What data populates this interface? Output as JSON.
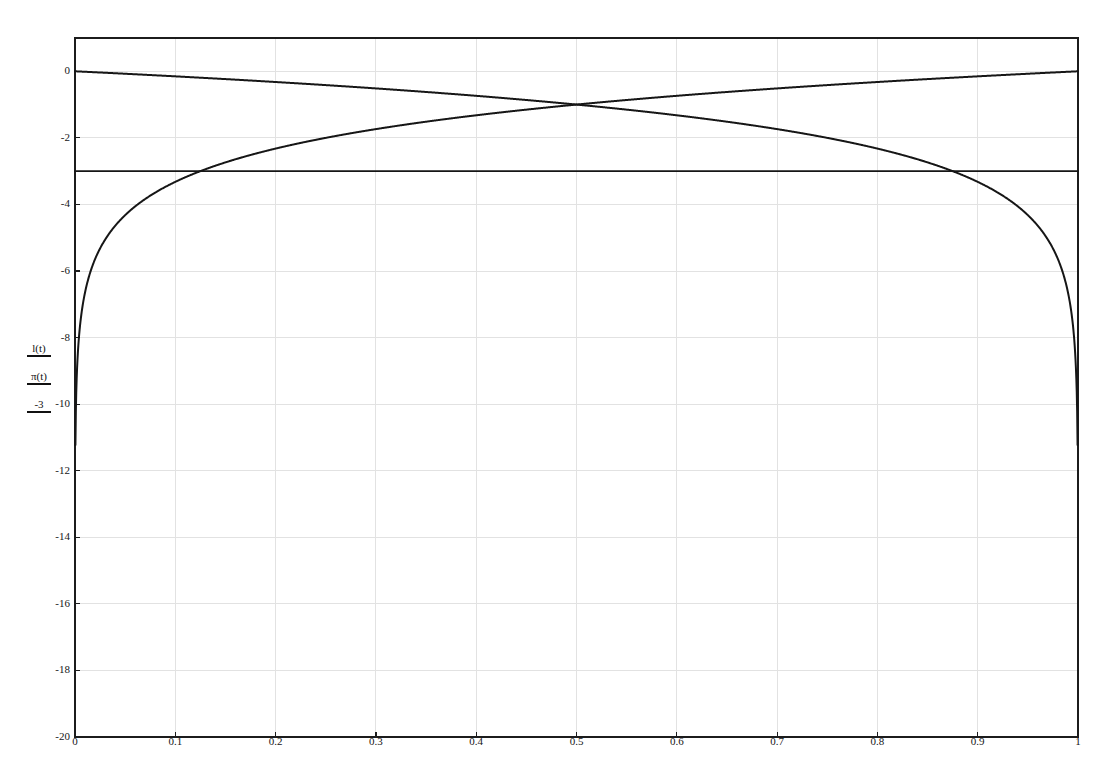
{
  "figure": {
    "background_color": "#ffffff",
    "frame_color": "#1c1c1c",
    "grid_color": "#e2e2e2",
    "curve_color": "#161616"
  },
  "axis_labels": {
    "y_stack": [
      {
        "name": "l-of-t",
        "text": "l(t)"
      },
      {
        "name": "pi-of-t",
        "text": "π(t)"
      },
      {
        "name": "minus-three",
        "text": "-3"
      }
    ]
  },
  "chart_data": {
    "type": "line",
    "title": "",
    "xlabel": "",
    "ylabel": "l(t)  π(t)  -3",
    "xlim": [
      0,
      1
    ],
    "ylim": [
      -20,
      1
    ],
    "grid": true,
    "legend_position": "none",
    "xticks": [
      0,
      0.1,
      0.2,
      0.3,
      0.4,
      0.5,
      0.6,
      0.7,
      0.8,
      0.9,
      1
    ],
    "xtick_labels": [
      "0",
      "0.1",
      "0.2",
      "0.3",
      "0.4",
      "0.5",
      "0.6",
      "0.7",
      "0.8",
      "0.9",
      "1"
    ],
    "yticks": [
      0,
      -2,
      -4,
      -6,
      -8,
      -10,
      -12,
      -14,
      -16,
      -18,
      -20
    ],
    "ytick_labels": [
      "0",
      "-2",
      "-4",
      "-6",
      "-8",
      "-10",
      "-12",
      "-14",
      "-16",
      "-18",
      "-20"
    ],
    "intersection": {
      "x": 0.5,
      "y": -3
    },
    "series": [
      {
        "name": "l(t)",
        "formula": "log2(1 - t)",
        "description": "descending log curve, starts near 0 at t=0, reaches -20 near t=0.937",
        "x": [
          0,
          0.02,
          0.05,
          0.1,
          0.15,
          0.2,
          0.25,
          0.3,
          0.35,
          0.4,
          0.45,
          0.5,
          0.55,
          0.6,
          0.65,
          0.7,
          0.75,
          0.8,
          0.85,
          0.9,
          0.92,
          0.94,
          0.95,
          0.96,
          0.97
        ],
        "values": [
          0,
          -0.029,
          -0.074,
          -0.152,
          -0.234,
          -0.322,
          -0.415,
          -0.515,
          -0.621,
          -0.737,
          -0.862,
          -1.0,
          -1.152,
          -1.322,
          -1.515,
          -1.737,
          -2.0,
          -2.322,
          -2.737,
          -3.322,
          -3.644,
          -4.059,
          -4.322,
          -4.644,
          -5.059
        ]
      },
      {
        "name": "pi(t)",
        "formula": "log2(t)",
        "description": "ascending log curve, reaches -20 near t=0.063, approaches 0 at t=1",
        "x": [
          0.03,
          0.05,
          0.08,
          0.1,
          0.15,
          0.2,
          0.25,
          0.3,
          0.35,
          0.4,
          0.45,
          0.5,
          0.55,
          0.6,
          0.65,
          0.7,
          0.75,
          0.8,
          0.85,
          0.9,
          0.95,
          1.0
        ],
        "values": [
          -5.059,
          -4.322,
          -3.644,
          -3.322,
          -2.737,
          -2.322,
          -2.0,
          -1.737,
          -1.515,
          -1.322,
          -1.152,
          -1.0,
          -0.862,
          -0.737,
          -0.621,
          -0.515,
          -0.415,
          -0.322,
          -0.234,
          -0.152,
          -0.074,
          0
        ]
      },
      {
        "name": "-3",
        "formula": "y = -3",
        "description": "horizontal constant reference line",
        "x": [
          0,
          1
        ],
        "values": [
          -3,
          -3
        ]
      }
    ]
  }
}
